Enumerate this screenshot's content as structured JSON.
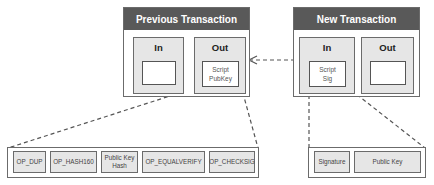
{
  "previous_transaction": {
    "title": "Previous Transaction",
    "in_label": "In",
    "out_label": "Out",
    "script_pubkey_line1": "Script",
    "script_pubkey_line2": "PubKey"
  },
  "new_transaction": {
    "title": "New Transaction",
    "in_label": "In",
    "out_label": "Out",
    "script_sig_line1": "Script",
    "script_sig_line2": "Sig"
  },
  "pubkey_script": [
    {
      "line1": "OP_DUP",
      "line2": ""
    },
    {
      "line1": "OP_HASH160",
      "line2": ""
    },
    {
      "line1": "Public Key",
      "line2": "Hash"
    },
    {
      "line1": "OP_EQUALVERIFY",
      "line2": ""
    },
    {
      "line1": "OP_CHECKSIG",
      "line2": ""
    }
  ],
  "sig_script": [
    {
      "line1": "Signature",
      "line2": ""
    },
    {
      "line1": "Public Key",
      "line2": ""
    }
  ],
  "colors": {
    "header_bg": "#595959",
    "box_fill": "#e6e6e6",
    "border": "#6b6b6b"
  }
}
